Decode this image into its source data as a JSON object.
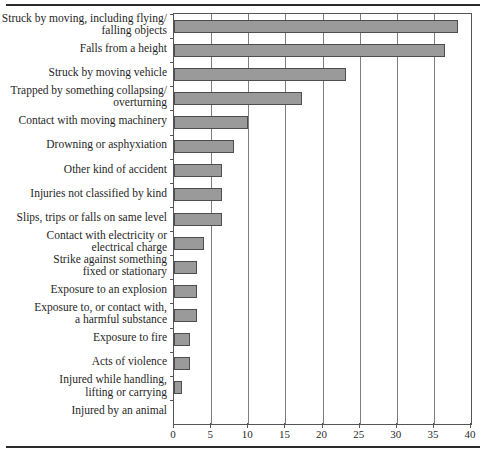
{
  "chart_data": {
    "type": "bar",
    "orientation": "horizontal",
    "title": "",
    "xlabel": "",
    "ylabel": "",
    "xlim": [
      0,
      40
    ],
    "xticks": [
      "0",
      "5",
      "10",
      "15",
      "20",
      "25",
      "30",
      "35",
      "40"
    ],
    "xtick_values": [
      0,
      5,
      10,
      15,
      20,
      25,
      30,
      35,
      40
    ],
    "grid": true,
    "grid_axis": "x",
    "legend": "none",
    "bar_color": "#9a9a9a",
    "bar_edge_color": "#4d4d4d",
    "categories": [
      "Struck by moving, including flying/\nfalling objects",
      "Falls from a height",
      "Struck by moving vehicle",
      "Trapped by something collapsing/\noverturning",
      "Contact with moving machinery",
      "Drowning or asphyxiation",
      "Other kind of accident",
      "Injuries not classified by kind",
      "Slips, trips or falls on same level",
      "Contact with electricity or\nelectrical charge",
      "Strike against something\nfixed or stationary",
      "Exposure to an explosion",
      "Exposure to, or contact with,\na harmful substance",
      "Exposure to fire",
      "Acts of violence",
      "Injured while handling,\nlifting or carrying",
      "Injured by an animal"
    ],
    "category_lines": [
      [
        "Struck by moving, including flying/",
        "falling objects"
      ],
      [
        "Falls from a height"
      ],
      [
        "Struck by moving vehicle"
      ],
      [
        "Trapped by something collapsing/",
        "overturning"
      ],
      [
        "Contact with moving machinery"
      ],
      [
        "Drowning or asphyxiation"
      ],
      [
        "Other kind of accident"
      ],
      [
        "Injuries not classified by kind"
      ],
      [
        "Slips, trips or falls on same level"
      ],
      [
        "Contact with electricity or",
        "electrical charge"
      ],
      [
        "Strike against something",
        "fixed or stationary"
      ],
      [
        "Exposure to an explosion"
      ],
      [
        "Exposure to, or contact with,",
        "a harmful substance"
      ],
      [
        "Exposure to fire"
      ],
      [
        "Acts of violence"
      ],
      [
        "Injured while handling,",
        "lifting or carrying"
      ],
      [
        "Injured by an animal"
      ]
    ],
    "values": [
      38.3,
      36.5,
      23.1,
      17.2,
      10.0,
      8.1,
      6.5,
      6.5,
      6.5,
      4.1,
      3.1,
      3.1,
      3.1,
      2.1,
      2.1,
      1.1,
      0.0
    ]
  }
}
